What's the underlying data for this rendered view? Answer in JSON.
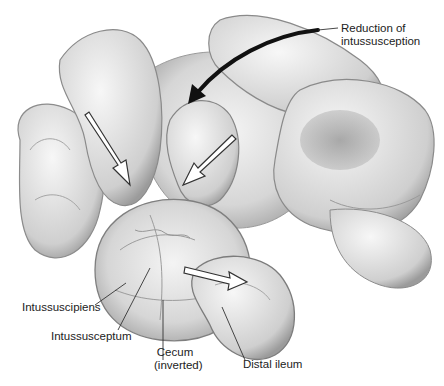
{
  "figure": {
    "labels": {
      "reduction_line1": "Reduction of",
      "reduction_line2": "intussusception",
      "intussuscipiens": "Intussuscipiens",
      "intussusceptum": "Intussusceptum",
      "cecum_line1": "Cecum",
      "cecum_line2": "(inverted)",
      "distal_ileum": "Distal ileum"
    },
    "colors": {
      "background": "#ffffff",
      "illustration_light": "#e6e6e6",
      "illustration_mid": "#c4c4c4",
      "illustration_dark": "#8a8a8a",
      "leader_line": "#333333",
      "arrow": "#111111"
    }
  }
}
